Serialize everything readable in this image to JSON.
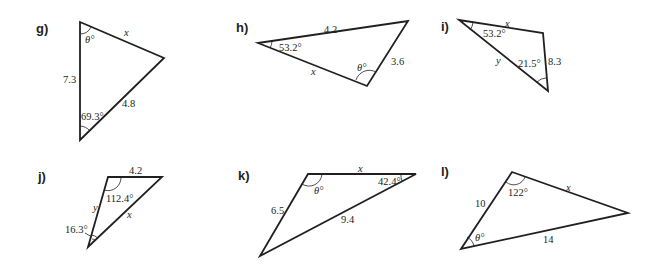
{
  "problems": {
    "g": {
      "label": "g)",
      "side_top": "x",
      "side_left": "7.3",
      "side_right": "4.8",
      "angle_top": "θ°",
      "angle_bottom": "69.3°"
    },
    "h": {
      "label": "h)",
      "side_top": "4.2",
      "side_right": "3.6",
      "side_bottom": "x",
      "angle_left": "53.2°",
      "angle_bottom": "θ°"
    },
    "i": {
      "label": "i)",
      "side_top": "x",
      "side_right": "8.3",
      "side_left": "y",
      "angle_left": "53.2°",
      "angle_bottom": "21.5°"
    },
    "j": {
      "label": "j)",
      "side_top": "4.2",
      "side_left": "y",
      "side_right": "x",
      "angle_top": "112.4°",
      "angle_bottom": "16.3°"
    },
    "k": {
      "label": "k)",
      "side_top": "x",
      "side_left": "6.5",
      "side_bottom": "9.4",
      "angle_top_left": "θ°",
      "angle_top_right": "42.4°"
    },
    "l": {
      "label": "l)",
      "side_left": "10",
      "side_top": "x",
      "side_bottom": "14",
      "angle_top": "122°",
      "angle_bottom": "θ°"
    }
  },
  "colors": {
    "ink": "#231f20",
    "background": "#ffffff"
  }
}
